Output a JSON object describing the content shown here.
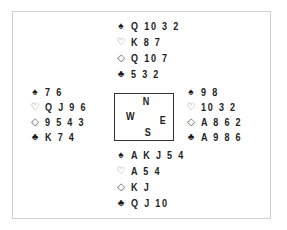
{
  "diagram": {
    "type": "bridge-deal",
    "hands": {
      "north": {
        "spades": "Q 10 3 2",
        "hearts": "K 8 7",
        "diamonds": "Q 10 7",
        "clubs": "5 3 2"
      },
      "west": {
        "spades": "7 6",
        "hearts": "Q J 9 6",
        "diamonds": "9 5 4 3",
        "clubs": "K 7 4"
      },
      "east": {
        "spades": "9 8",
        "hearts": "10 3 2",
        "diamonds": "A 8 6 2",
        "clubs": "A 9 8 6"
      },
      "south": {
        "spades": "A K J 5 4",
        "hearts": "A 5 4",
        "diamonds": "K J",
        "clubs": "Q J 10"
      }
    },
    "compass": {
      "north": "N",
      "south": "S",
      "east": "E",
      "west": "W"
    },
    "suit_icons": {
      "spades": "♠",
      "hearts": "♡",
      "diamonds": "◇",
      "clubs": "♣"
    }
  }
}
